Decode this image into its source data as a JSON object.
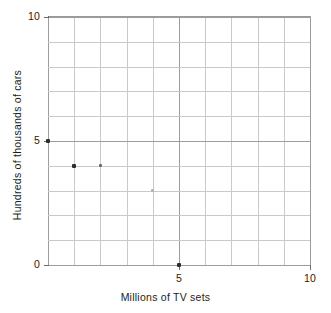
{
  "chart_data": {
    "type": "scatter",
    "title": "",
    "xlabel": "Millions of TV sets",
    "ylabel": "Hundreds of thousands of cars",
    "xlim": [
      0,
      10
    ],
    "ylim": [
      0,
      10
    ],
    "grid": true,
    "legend": "none",
    "x_ticks": [
      {
        "value": 0,
        "label": ""
      },
      {
        "value": 5,
        "label": "5"
      },
      {
        "value": 10,
        "label": "10"
      }
    ],
    "y_ticks": [
      {
        "value": 0,
        "label": "0"
      },
      {
        "value": 5,
        "label": "5"
      },
      {
        "value": 10,
        "label": "10"
      }
    ],
    "x_gridlines": [
      0,
      1,
      2,
      3,
      4,
      5,
      6,
      7,
      8,
      9,
      10
    ],
    "y_gridlines": [
      0,
      1,
      2,
      3,
      4,
      5,
      6,
      7,
      8,
      9,
      10
    ],
    "major_gridlines": [
      0,
      5,
      10
    ],
    "points": [
      {
        "x": 0,
        "y": 5,
        "weight": "dark"
      },
      {
        "x": 1,
        "y": 4,
        "weight": "dark"
      },
      {
        "x": 2,
        "y": 4,
        "weight": "medium"
      },
      {
        "x": 4,
        "y": 3,
        "weight": "faint"
      },
      {
        "x": 5,
        "y": 0,
        "weight": "dark"
      }
    ]
  },
  "colors": {
    "point": "#2e2e2e",
    "grid": "#c9c9c9",
    "grid_major": "#9d9d9d",
    "axis": "#6d6d6d",
    "text": "#1d1d1d",
    "background": "#ffffff"
  }
}
